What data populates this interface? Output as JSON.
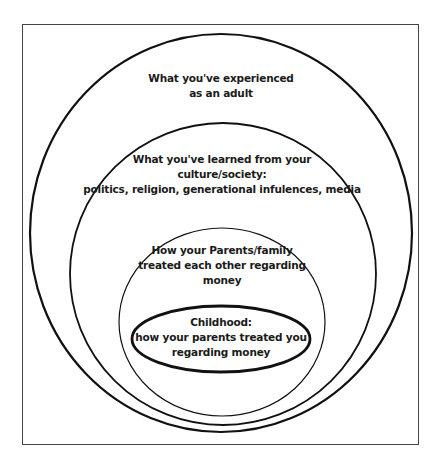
{
  "diagram": {
    "type": "nested-ellipses",
    "stroke_color": "#111111",
    "frame_color": "#444444",
    "layers": [
      {
        "id": "adult",
        "lines": [
          "What you've experienced",
          "as an adult"
        ]
      },
      {
        "id": "culture",
        "lines": [
          "What you've learned from your",
          "culture/society:",
          "politics, religion, generational infulences, media"
        ]
      },
      {
        "id": "parents-family",
        "lines": [
          "How your Parents/family",
          "treated each other regarding",
          "money"
        ]
      },
      {
        "id": "childhood",
        "lines": [
          "Childhood:",
          "how your parents treated you",
          "regarding money"
        ]
      }
    ]
  }
}
